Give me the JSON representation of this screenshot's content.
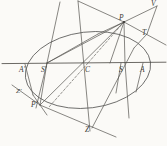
{
  "figure": {
    "kind": "geometric-construction",
    "background_color": "#fbfaf7",
    "ink_color": "#4a4a48",
    "labels": [
      {
        "id": "A-prime",
        "text": "A'",
        "x": 19,
        "y": 66
      },
      {
        "id": "S-prime",
        "text": "S'",
        "x": 41,
        "y": 66
      },
      {
        "id": "C",
        "text": "C",
        "x": 85,
        "y": 66
      },
      {
        "id": "S",
        "text": "S",
        "x": 119,
        "y": 66
      },
      {
        "id": "A",
        "text": "A",
        "x": 140,
        "y": 66
      },
      {
        "id": "P",
        "text": "P",
        "x": 119,
        "y": 15
      },
      {
        "id": "V",
        "text": "V",
        "x": 151,
        "y": 1
      },
      {
        "id": "T",
        "text": "T",
        "x": 142,
        "y": 29
      },
      {
        "id": "Z-prime",
        "text": "Z'",
        "x": 16,
        "y": 88
      },
      {
        "id": "P-prime",
        "text": "P'",
        "x": 31,
        "y": 101
      },
      {
        "id": "Z",
        "text": "Z",
        "x": 85,
        "y": 126
      }
    ],
    "ellipse": {
      "center_x": 88,
      "center_y": 70,
      "radius_x": 63,
      "radius_y": 38,
      "rotation_deg": -7
    },
    "major_axis": {
      "x1": 2,
      "y1": 63,
      "x2": 166,
      "y2": 62
    },
    "points": {
      "A_prime": {
        "x": 25,
        "y": 64
      },
      "S_prime": {
        "x": 47,
        "y": 63
      },
      "C": {
        "x": 88,
        "y": 63
      },
      "S": {
        "x": 125,
        "y": 63
      },
      "A": {
        "x": 147,
        "y": 62
      },
      "P": {
        "x": 124,
        "y": 22
      },
      "P_prime": {
        "x": 40,
        "y": 105
      },
      "T": {
        "x": 147,
        "y": 34
      },
      "V": {
        "x": 157,
        "y": 6
      },
      "Z": {
        "x": 90,
        "y": 131
      },
      "Z_prime": {
        "x": 22,
        "y": 93
      },
      "apex": {
        "x": 78,
        "y": 1
      }
    }
  }
}
